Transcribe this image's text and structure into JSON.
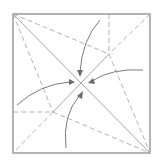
{
  "diagram": {
    "type": "origami-fold-diagram",
    "colors": {
      "border": "#8a8a8a",
      "solid_crease": "#a6a6a6",
      "dashed_crease": "#b3b3b3",
      "arrow": "#7a7a7a"
    },
    "creases": [
      {
        "name": "main-diagonal",
        "style": "solid",
        "from": "top-left-corner",
        "to": "bottom-right-corner"
      },
      {
        "name": "anti-diagonal-upper",
        "style": "dashed",
        "from": "top-right-corner",
        "to": "upper-point"
      },
      {
        "name": "anti-diagonal-middle",
        "style": "solid",
        "from": "upper-point",
        "to": "lower-point"
      },
      {
        "name": "anti-diagonal-lower",
        "style": "dashed",
        "from": "lower-point",
        "to": "bottom-left-corner"
      },
      {
        "name": "vertical-top",
        "style": "dashed",
        "from": "top-edge",
        "to": "upper-point"
      },
      {
        "name": "horizontal-left",
        "style": "dashed",
        "from": "left-edge",
        "to": "lower-point"
      },
      {
        "name": "top-left-to-upper",
        "style": "dashed",
        "from": "top-left-corner",
        "to": "upper-point"
      },
      {
        "name": "top-left-to-lower",
        "style": "dashed",
        "from": "top-left-corner",
        "to": "lower-point"
      },
      {
        "name": "upper-to-bottom-right",
        "style": "dashed",
        "from": "upper-point",
        "to": "bottom-right-corner"
      },
      {
        "name": "lower-to-bottom-right",
        "style": "dashed",
        "from": "lower-point",
        "to": "bottom-right-corner"
      }
    ],
    "arrows": [
      {
        "name": "arrow-from-top",
        "direction": "down"
      },
      {
        "name": "arrow-from-right",
        "direction": "left"
      },
      {
        "name": "arrow-from-left",
        "direction": "right"
      },
      {
        "name": "arrow-from-bottom",
        "direction": "up"
      }
    ]
  }
}
